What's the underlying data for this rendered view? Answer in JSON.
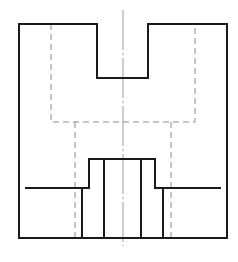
{
  "diagram": {
    "type": "orthographic-technical-drawing",
    "view": "front-view",
    "colors": {
      "background": "#ffffff",
      "visible_line": "#1a1a1a",
      "hidden_line": "#8a8a8a",
      "center_line": "#9a9a9a"
    },
    "outline": {
      "description": "outer profile with top rectangular notch",
      "points": [
        [
          19,
          24
        ],
        [
          97,
          24
        ],
        [
          97,
          78
        ],
        [
          148,
          78
        ],
        [
          148,
          24
        ],
        [
          227,
          24
        ],
        [
          227,
          238
        ],
        [
          19,
          238
        ]
      ]
    },
    "hidden_lines": [
      {
        "name": "hidden-inner-cavity",
        "points": [
          [
            51,
            24
          ],
          [
            51,
            122
          ],
          [
            195,
            122
          ],
          [
            195,
            24
          ]
        ]
      },
      {
        "name": "hidden-left-bore",
        "points": [
          [
            75,
            122
          ],
          [
            75,
            238
          ]
        ]
      },
      {
        "name": "hidden-right-bore",
        "points": [
          [
            171,
            122
          ],
          [
            171,
            238
          ]
        ]
      }
    ],
    "center_line": {
      "x": 123,
      "y1": 10,
      "y2": 246
    },
    "stepped_profile": {
      "points": [
        [
          26,
          188
        ],
        [
          89,
          188
        ],
        [
          89,
          159
        ],
        [
          155,
          159
        ],
        [
          155,
          188
        ],
        [
          220,
          188
        ]
      ]
    },
    "visible_verticals": [
      {
        "name": "left-step-edge",
        "x": 82,
        "y1": 188,
        "y2": 238
      },
      {
        "name": "left-inner-edge",
        "x": 104,
        "y1": 159,
        "y2": 238
      },
      {
        "name": "right-inner-edge",
        "x": 141,
        "y1": 159,
        "y2": 238
      },
      {
        "name": "right-step-edge",
        "x": 163,
        "y1": 188,
        "y2": 238
      }
    ]
  }
}
